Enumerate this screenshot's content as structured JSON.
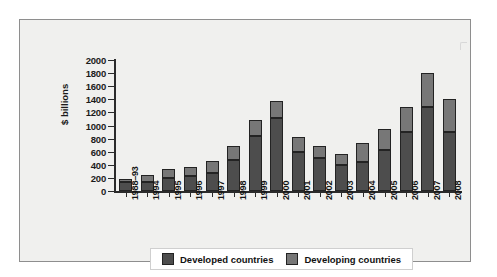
{
  "chart_data": {
    "type": "bar",
    "subtype": "stacked-vertical",
    "title": "",
    "xlabel": "",
    "ylabel": "$ billions",
    "ylim": [
      0,
      2000
    ],
    "yticks": [
      0,
      200,
      400,
      600,
      800,
      1000,
      1200,
      1400,
      1600,
      1800,
      2000
    ],
    "grid": false,
    "legend_position": "bottom",
    "categories": [
      "1988–93",
      "1994",
      "1995",
      "1996",
      "1997",
      "1998",
      "1999",
      "2000",
      "2001",
      "2002",
      "2003",
      "2004",
      "2005",
      "2006",
      "2007",
      "2008"
    ],
    "series": [
      {
        "name": "Developed countries",
        "color": "#4d4d4d",
        "values": [
          140,
          140,
          200,
          230,
          280,
          480,
          840,
          1120,
          600,
          510,
          390,
          450,
          630,
          900,
          1280,
          900
        ]
      },
      {
        "name": "Developing countries",
        "color": "#777777",
        "values": [
          40,
          110,
          130,
          140,
          180,
          210,
          240,
          260,
          220,
          170,
          180,
          290,
          320,
          380,
          520,
          500
        ]
      }
    ],
    "totals": [
      180,
      250,
      330,
      370,
      460,
      690,
      1080,
      1380,
      820,
      680,
      570,
      740,
      950,
      1280,
      1800,
      1400
    ]
  },
  "legend": {
    "items": [
      {
        "label": "Developed countries",
        "color": "#4d4d4d"
      },
      {
        "label": "Developing countries",
        "color": "#777777"
      }
    ]
  },
  "axis": {
    "y_title": "$ billions"
  },
  "colors": {
    "panel_background": "#f0f0ee",
    "panel_border": "#8e8e8e",
    "axis": "#2b2b2b",
    "developed": "#4d4d4d",
    "developing": "#777777",
    "legend_background": "#ffffff"
  }
}
